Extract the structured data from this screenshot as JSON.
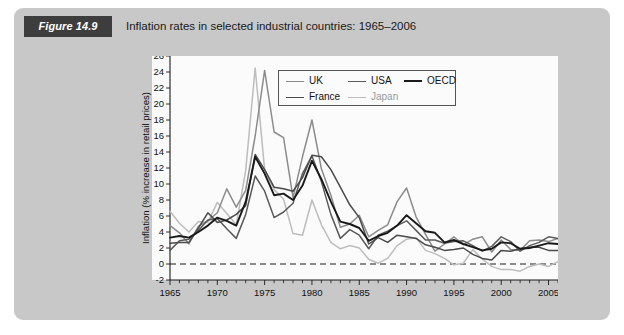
{
  "figure": {
    "number_label": "Figure 14.9",
    "caption": "Inflation rates in selected industrial countries: 1965–2006",
    "panel_color": "#c8c8c8",
    "number_badge_color": "#3d3d3d"
  },
  "chart_data": {
    "type": "line",
    "title": "Inflation rates in selected industrial countries: 1965–2006",
    "xlabel": "",
    "ylabel": "Inflation (% increase in retail prices)",
    "xlim": [
      1965,
      2006
    ],
    "ylim": [
      -2,
      26
    ],
    "ytick_step": 2,
    "yticks": [
      -2,
      0,
      2,
      4,
      6,
      8,
      10,
      12,
      14,
      16,
      18,
      20,
      22,
      24,
      26
    ],
    "ytick_labels": [
      "-2",
      "0",
      "2",
      "4",
      "6",
      "8",
      "10",
      "12",
      "14",
      "16",
      "18",
      "20",
      "22",
      "24",
      "26"
    ],
    "xticks": [
      1965,
      1970,
      1975,
      1980,
      1985,
      1990,
      1995,
      2000,
      2005
    ],
    "xtick_labels": [
      "1965",
      "1970",
      "1975",
      "1980",
      "1985",
      "1990",
      "1995",
      "2000",
      "2005"
    ],
    "x_minor_tick_step": 1,
    "grid": false,
    "zero_reference_line": true,
    "legend_position": "top-center",
    "x": [
      1965,
      1966,
      1967,
      1968,
      1969,
      1970,
      1971,
      1972,
      1973,
      1974,
      1975,
      1976,
      1977,
      1978,
      1979,
      1980,
      1981,
      1982,
      1983,
      1984,
      1985,
      1986,
      1987,
      1988,
      1989,
      1990,
      1991,
      1992,
      1993,
      1994,
      1995,
      1996,
      1997,
      1998,
      1999,
      2000,
      2001,
      2002,
      2003,
      2004,
      2005,
      2006
    ],
    "series": [
      {
        "name": "UK",
        "color": "#8c8c8c",
        "width": 1.5,
        "values": [
          4.8,
          3.9,
          2.5,
          4.7,
          5.4,
          6.4,
          9.4,
          7.1,
          9.2,
          16.0,
          24.2,
          16.5,
          15.8,
          8.3,
          13.4,
          18.0,
          11.9,
          8.6,
          4.6,
          5.0,
          6.1,
          3.4,
          4.2,
          4.9,
          7.8,
          9.5,
          5.9,
          3.7,
          1.6,
          2.5,
          3.4,
          2.4,
          3.1,
          3.4,
          1.5,
          3.0,
          1.8,
          1.7,
          2.9,
          3.0,
          2.8,
          3.2
        ]
      },
      {
        "name": "USA",
        "color": "#5a5a5a",
        "width": 1.5,
        "values": [
          1.7,
          2.9,
          3.1,
          4.2,
          5.5,
          5.7,
          4.4,
          3.2,
          6.2,
          11.0,
          9.1,
          5.8,
          6.5,
          7.6,
          11.3,
          13.5,
          10.3,
          6.2,
          3.2,
          4.3,
          3.6,
          1.9,
          3.6,
          4.1,
          4.8,
          5.4,
          4.2,
          3.0,
          3.0,
          2.6,
          2.8,
          2.9,
          2.3,
          1.6,
          2.2,
          3.4,
          2.8,
          1.6,
          2.3,
          2.7,
          3.4,
          3.2
        ]
      },
      {
        "name": "OECD",
        "color": "#1a1a1a",
        "width": 1.9,
        "values": [
          3.3,
          3.5,
          3.3,
          4.0,
          4.8,
          5.8,
          5.4,
          4.8,
          7.8,
          13.4,
          11.3,
          8.6,
          8.8,
          8.0,
          9.8,
          12.9,
          10.6,
          7.8,
          5.3,
          5.0,
          4.5,
          2.9,
          3.5,
          3.9,
          4.8,
          6.1,
          5.1,
          4.1,
          3.9,
          2.7,
          3.0,
          2.5,
          2.1,
          1.7,
          1.9,
          2.7,
          2.6,
          1.9,
          2.0,
          2.3,
          2.6,
          2.5
        ]
      },
      {
        "name": "France",
        "color": "#4a4a4a",
        "width": 1.5,
        "values": [
          2.6,
          2.7,
          2.7,
          4.5,
          6.4,
          5.2,
          5.5,
          6.2,
          7.3,
          13.7,
          11.8,
          9.6,
          9.4,
          9.1,
          10.8,
          13.6,
          13.4,
          11.8,
          9.6,
          7.4,
          5.8,
          2.5,
          3.3,
          2.7,
          3.6,
          3.4,
          3.2,
          2.4,
          2.1,
          1.7,
          1.8,
          2.0,
          1.2,
          0.7,
          0.5,
          1.7,
          1.6,
          1.9,
          2.1,
          2.1,
          1.7,
          1.7
        ]
      },
      {
        "name": "Japan",
        "color": "#bdbdbd",
        "width": 1.5,
        "values": [
          6.6,
          5.1,
          4.0,
          5.3,
          5.2,
          7.7,
          6.3,
          4.9,
          11.7,
          24.5,
          11.8,
          9.3,
          8.1,
          3.8,
          3.6,
          8.0,
          4.9,
          2.7,
          1.9,
          2.3,
          2.0,
          0.6,
          0.1,
          0.7,
          2.3,
          3.1,
          3.3,
          1.7,
          1.3,
          0.7,
          -0.1,
          0.1,
          1.8,
          0.6,
          -0.3,
          -0.7,
          -0.7,
          -0.9,
          -0.3,
          0.0,
          -0.3,
          0.3
        ]
      }
    ]
  },
  "legend": {
    "rows": [
      [
        {
          "label": "UK",
          "color": "#8c8c8c"
        },
        {
          "label": "USA",
          "color": "#5a5a5a"
        },
        {
          "label": "OECD",
          "color": "#1a1a1a"
        }
      ],
      [
        {
          "label": "France",
          "color": "#4a4a4a"
        },
        {
          "label": "Japan",
          "color": "#bdbdbd"
        }
      ]
    ]
  }
}
